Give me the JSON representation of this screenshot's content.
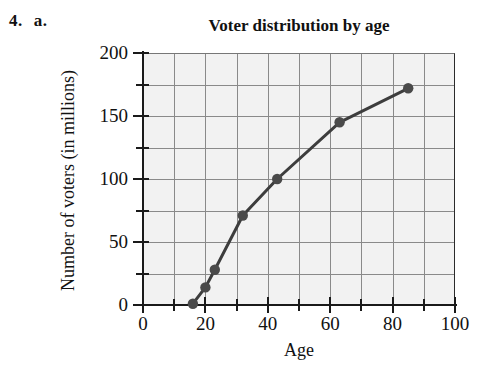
{
  "problem": {
    "number": "4.",
    "part": "a."
  },
  "chart_data": {
    "type": "line",
    "title": "Voter distribution by age",
    "xlabel": "Age",
    "ylabel": "Number of voters (in millions)",
    "x": [
      16,
      20,
      23,
      32,
      43,
      63,
      85
    ],
    "values": [
      1,
      14,
      28,
      71,
      100,
      145,
      172
    ],
    "points": [
      {
        "x": 16,
        "y": 1
      },
      {
        "x": 20,
        "y": 14
      },
      {
        "x": 23,
        "y": 28
      },
      {
        "x": 32,
        "y": 71
      },
      {
        "x": 43,
        "y": 100
      },
      {
        "x": 63,
        "y": 145
      },
      {
        "x": 85,
        "y": 172
      }
    ],
    "xlim": [
      0,
      100
    ],
    "ylim": [
      0,
      200
    ],
    "x_ticks": [
      0,
      20,
      40,
      60,
      80,
      100
    ],
    "x_tick_labels": [
      "0",
      "20",
      "40",
      "60",
      "80",
      "100"
    ],
    "x_minor_ticks": [
      10,
      30,
      50,
      70,
      90
    ],
    "y_ticks": [
      0,
      50,
      100,
      150,
      200
    ],
    "y_tick_labels": [
      "0",
      "50",
      "100",
      "150",
      "200"
    ],
    "y_minor_ticks": [
      25,
      75,
      125,
      175
    ],
    "grid": true,
    "grid_x_step": 10,
    "grid_y_step": 25,
    "legend": "none",
    "marker": "circle",
    "line_color": "#3d3d3d",
    "marker_color": "#4a4a4a",
    "plot_background": "#f2f2f2",
    "grid_color": "#8a8a8a"
  }
}
